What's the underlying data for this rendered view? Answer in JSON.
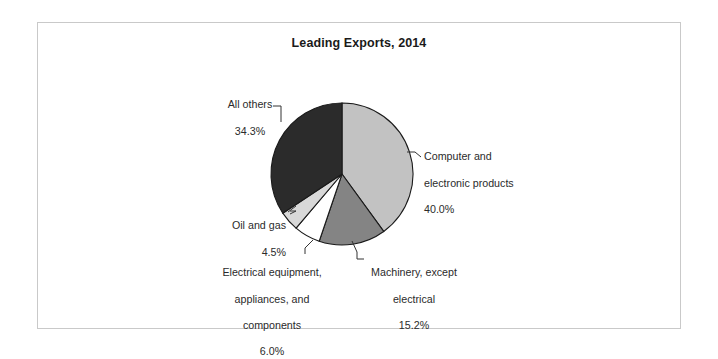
{
  "chart_data": {
    "type": "pie",
    "title": "Leading Exports, 2014",
    "xlabel": "",
    "ylabel": "",
    "legend_position": "none",
    "grid": false,
    "labels": [
      "Computer and electronic products",
      "Machinery, except electrical",
      "Electrical equipment, appliances, and components",
      "Oil and gas",
      "All others"
    ],
    "values": [
      40.0,
      15.2,
      6.0,
      4.5,
      34.3
    ],
    "value_labels": [
      "40.0%",
      "15.2%",
      "6.0%",
      "4.5%",
      "34.3%"
    ],
    "colors": [
      "#c2c2c2",
      "#848484",
      "#ffffff",
      "#d8d8d8",
      "#2b2b2b"
    ],
    "start_angle_deg": 0,
    "direction": "clockwise",
    "slices": [
      {
        "name": "computer-and-electronic-products",
        "label_line1": "Computer and",
        "label_line2": "electronic products",
        "percent_text": "40.0%",
        "value": 40.0,
        "color": "#c2c2c2"
      },
      {
        "name": "machinery-except-electrical",
        "label_line1": "Machinery, except",
        "label_line2": "electrical",
        "percent_text": "15.2%",
        "value": 15.2,
        "color": "#848484"
      },
      {
        "name": "electrical-equipment-appliances-and-components",
        "label_line1": "Electrical equipment,",
        "label_line2": "appliances, and",
        "label_line3": "components",
        "percent_text": "6.0%",
        "value": 6.0,
        "color": "#ffffff"
      },
      {
        "name": "oil-and-gas",
        "label_line1": "Oil and gas",
        "percent_text": "4.5%",
        "value": 4.5,
        "color": "#d8d8d8"
      },
      {
        "name": "all-others",
        "label_line1": "All others",
        "percent_text": "34.3%",
        "value": 34.3,
        "color": "#2b2b2b"
      }
    ]
  },
  "frame": {
    "border_color": "#c9c9c9",
    "background": "#ffffff"
  }
}
